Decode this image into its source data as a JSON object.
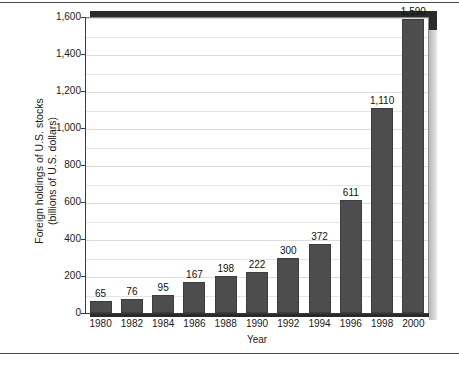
{
  "chart_data": {
    "type": "bar",
    "title": "",
    "xlabel": "Year",
    "ylabel_line1": "Foreign holdings of U.S. stocks",
    "ylabel_line2": "(billions of U.S. dollars)",
    "categories": [
      "1980",
      "1982",
      "1984",
      "1986",
      "1988",
      "1990",
      "1992",
      "1994",
      "1996",
      "1998",
      "2000"
    ],
    "values": [
      65,
      76,
      95,
      167,
      198,
      222,
      300,
      372,
      611,
      1110,
      1590
    ],
    "value_labels": [
      "65",
      "76",
      "95",
      "167",
      "198",
      "222",
      "300",
      "372",
      "611",
      "1,110",
      "1,590"
    ],
    "ylim": [
      0,
      1600
    ],
    "ytick_values": [
      0,
      200,
      400,
      600,
      800,
      1000,
      1200,
      1400,
      1600
    ],
    "ytick_labels": [
      "0",
      "200",
      "400",
      "600",
      "800",
      "1,000",
      "1,200",
      "1,400",
      "1,600"
    ],
    "minor_gridline_values": [
      100,
      300,
      500,
      700,
      900,
      1100,
      1300,
      1500
    ],
    "grid": true,
    "legend": "none",
    "bar_color": "#4d4d4d",
    "plot_background": "#ffffff",
    "gridline_color": "#e6e6e6",
    "frame_shadow_color": "#2a2a2a"
  }
}
